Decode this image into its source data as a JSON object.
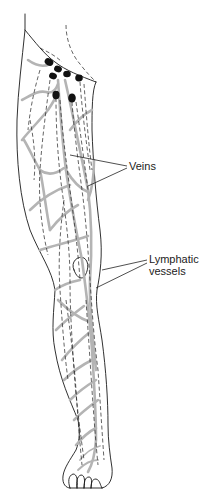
{
  "figure": {
    "labels": {
      "veins": "Veins",
      "lymphatic_line1": "Lymphatic",
      "lymphatic_line2": "vessels"
    },
    "colors": {
      "background": "#ffffff",
      "outline": "#1a1a1a",
      "veins": "#b4b4b4",
      "lymphatic_vessels": "#222222",
      "lymph_nodes": "#111111"
    },
    "lymph_nodes": [
      {
        "cx": 49,
        "cy": 62,
        "rx": 4.5,
        "ry": 3.5
      },
      {
        "cx": 58,
        "cy": 69,
        "rx": 4,
        "ry": 3.2
      },
      {
        "cx": 53,
        "cy": 76,
        "rx": 4,
        "ry": 3.2
      },
      {
        "cx": 67,
        "cy": 74,
        "rx": 3.8,
        "ry": 3.2
      },
      {
        "cx": 79,
        "cy": 78,
        "rx": 3.8,
        "ry": 3.4
      },
      {
        "cx": 56,
        "cy": 95,
        "rx": 3.6,
        "ry": 4.2
      },
      {
        "cx": 72,
        "cy": 98,
        "rx": 3.8,
        "ry": 4.5
      }
    ]
  }
}
